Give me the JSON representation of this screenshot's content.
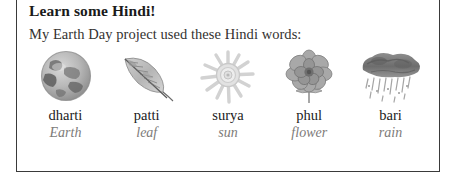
{
  "card": {
    "heading": "Learn some Hindi!",
    "subtitle": "My Earth Day project used these Hindi words:",
    "border_color": "#3a3a3a",
    "background_color": "#ffffff",
    "term_color": "#1b1b1b",
    "gloss_color": "#7d7b79"
  },
  "words": [
    {
      "term": "dharti",
      "gloss": "Earth",
      "icon": "earth-globe-illustration"
    },
    {
      "term": "patti",
      "gloss": "leaf",
      "icon": "leaf-illustration"
    },
    {
      "term": "surya",
      "gloss": "sun",
      "icon": "sun-illustration"
    },
    {
      "term": "phul",
      "gloss": "flower",
      "icon": "flower-illustration"
    },
    {
      "term": "bari",
      "gloss": "rain",
      "icon": "rain-cloud-illustration"
    }
  ]
}
